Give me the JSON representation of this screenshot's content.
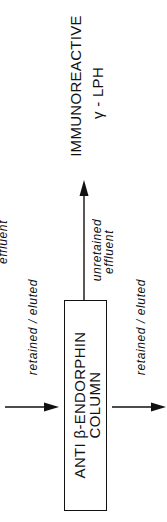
{
  "diagram": {
    "output_label": {
      "line1": "IMMUNOREACTIVE",
      "line2": "γ - LPH"
    },
    "column": {
      "line1": "ANTI  β-ENDORPHIN",
      "line2": "COLUMN"
    },
    "unretained_label": {
      "line1": "unretained",
      "line2": "effluent"
    },
    "input_label": "retained / eluted",
    "output_retained_label": "retained / eluted",
    "partial_left_label": "effluent"
  },
  "colors": {
    "ink": "#111111",
    "background": "#ffffff"
  }
}
